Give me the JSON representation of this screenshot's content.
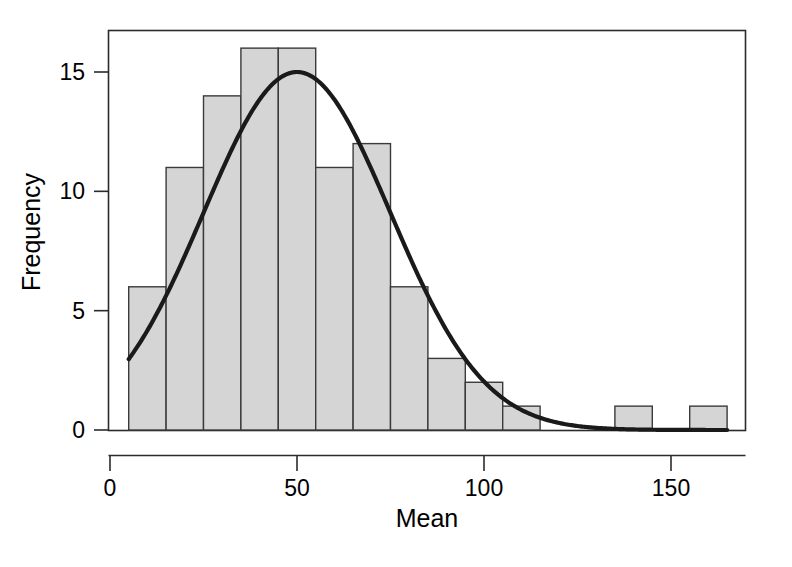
{
  "chart_data": {
    "type": "bar",
    "subtype": "histogram-with-normal-curve",
    "title": "",
    "subtitle": "",
    "xlabel": "Mean",
    "ylabel": "Frequency",
    "xlim": [
      -3,
      175
    ],
    "ylim": [
      0,
      17
    ],
    "grid": false,
    "legend": null,
    "bin_width": 10,
    "bin_starts": [
      5,
      15,
      25,
      35,
      45,
      55,
      65,
      75,
      85,
      95,
      105,
      115,
      125,
      135,
      145,
      155
    ],
    "bin_ends": [
      15,
      25,
      35,
      45,
      55,
      65,
      75,
      85,
      95,
      105,
      115,
      125,
      135,
      145,
      155,
      165
    ],
    "categories": [
      "5-15",
      "15-25",
      "25-35",
      "35-45",
      "45-55",
      "55-65",
      "65-75",
      "75-85",
      "85-95",
      "95-105",
      "105-115",
      "115-125",
      "125-135",
      "135-145",
      "145-155",
      "155-165"
    ],
    "values": [
      6,
      11,
      14,
      16,
      16,
      11,
      12,
      6,
      3,
      2,
      1,
      0,
      0,
      1,
      0,
      1
    ],
    "x_ticks": [
      0,
      50,
      100,
      150
    ],
    "x_tick_labels": [
      "0",
      "50",
      "100",
      "150"
    ],
    "y_ticks": [
      0,
      5,
      10,
      15
    ],
    "y_tick_labels": [
      "0",
      "5",
      "10",
      "15"
    ],
    "curve": {
      "name": "normal density overlay",
      "peak_x": 50,
      "peak_y": 15,
      "mean": 50,
      "sd": 25,
      "scale_n_binwidth": 940,
      "x_start": 5,
      "x_end": 165
    },
    "colors": {
      "bar_fill": "#d5d5d5",
      "bar_stroke": "#3a3a3a",
      "curve": "#1a1a1a",
      "axis": "#2b2b2b",
      "text": "#000000",
      "background": "#ffffff"
    }
  },
  "axes": {
    "x_title": "Mean",
    "y_title": "Frequency"
  }
}
